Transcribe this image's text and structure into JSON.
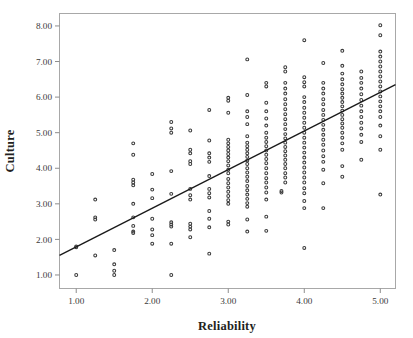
{
  "chart_data": {
    "type": "scatter",
    "title": "",
    "xlabel": "Reliability",
    "ylabel": "Culture",
    "xlim": [
      0.78,
      5.2
    ],
    "ylim": [
      0.62,
      8.35
    ],
    "grid": false,
    "legend": null,
    "xticks": [
      1.0,
      2.0,
      3.0,
      4.0,
      5.0
    ],
    "xtick_labels": [
      "1.00",
      "2.00",
      "3.00",
      "4.00",
      "5.00"
    ],
    "yticks": [
      1.0,
      2.0,
      3.0,
      4.0,
      5.0,
      6.0,
      7.0,
      8.0
    ],
    "ytick_labels": [
      "1.00",
      "2.00",
      "3.00",
      "4.00",
      "5.00",
      "6.00",
      "7.00",
      "8.00"
    ],
    "marker": "open-circle",
    "marker_color": "#3b3b3b",
    "fit_line": {
      "type": "linear",
      "x": [
        0.78,
        5.2
      ],
      "y": [
        1.55,
        6.35
      ],
      "slope": 1.086,
      "intercept": 0.703,
      "color": "#1a1a1a"
    },
    "series": [
      {
        "name": "Culture vs Reliability",
        "points": [
          [
            1.0,
            1.0
          ],
          [
            1.0,
            1.78
          ],
          [
            1.0,
            1.8
          ],
          [
            1.25,
            3.12
          ],
          [
            1.25,
            2.62
          ],
          [
            1.25,
            2.56
          ],
          [
            1.25,
            1.55
          ],
          [
            1.5,
            1.7
          ],
          [
            1.5,
            1.3
          ],
          [
            1.5,
            1.12
          ],
          [
            1.5,
            1.0
          ],
          [
            1.75,
            4.7
          ],
          [
            1.75,
            4.38
          ],
          [
            1.75,
            3.68
          ],
          [
            1.75,
            3.6
          ],
          [
            1.75,
            3.52
          ],
          [
            1.75,
            3.0
          ],
          [
            1.75,
            2.62
          ],
          [
            1.75,
            2.38
          ],
          [
            1.75,
            2.22
          ],
          [
            1.75,
            2.18
          ],
          [
            2.0,
            3.84
          ],
          [
            2.0,
            3.4
          ],
          [
            2.0,
            3.16
          ],
          [
            2.0,
            2.58
          ],
          [
            2.0,
            2.28
          ],
          [
            2.0,
            2.12
          ],
          [
            2.0,
            1.88
          ],
          [
            2.25,
            5.3
          ],
          [
            2.25,
            5.12
          ],
          [
            2.25,
            5.0
          ],
          [
            2.25,
            3.92
          ],
          [
            2.25,
            3.28
          ],
          [
            2.25,
            2.48
          ],
          [
            2.25,
            2.42
          ],
          [
            2.25,
            2.36
          ],
          [
            2.25,
            1.88
          ],
          [
            2.25,
            1.0
          ],
          [
            2.5,
            5.06
          ],
          [
            2.5,
            4.52
          ],
          [
            2.5,
            4.42
          ],
          [
            2.5,
            4.2
          ],
          [
            2.5,
            4.12
          ],
          [
            2.5,
            3.42
          ],
          [
            2.5,
            3.24
          ],
          [
            2.5,
            3.12
          ],
          [
            2.5,
            2.44
          ],
          [
            2.5,
            2.36
          ],
          [
            2.5,
            2.28
          ],
          [
            2.5,
            2.06
          ],
          [
            2.75,
            5.64
          ],
          [
            2.75,
            4.78
          ],
          [
            2.75,
            4.42
          ],
          [
            2.75,
            4.3
          ],
          [
            2.75,
            4.18
          ],
          [
            2.75,
            3.78
          ],
          [
            2.75,
            3.42
          ],
          [
            2.75,
            3.3
          ],
          [
            2.75,
            3.18
          ],
          [
            2.75,
            2.8
          ],
          [
            2.75,
            2.58
          ],
          [
            2.75,
            2.34
          ],
          [
            2.75,
            1.6
          ],
          [
            3.0,
            5.98
          ],
          [
            3.0,
            5.9
          ],
          [
            3.0,
            5.56
          ],
          [
            3.0,
            4.8
          ],
          [
            3.0,
            4.7
          ],
          [
            3.0,
            4.6
          ],
          [
            3.0,
            4.5
          ],
          [
            3.0,
            4.4
          ],
          [
            3.0,
            4.3
          ],
          [
            3.0,
            4.2
          ],
          [
            3.0,
            4.08
          ],
          [
            3.0,
            3.96
          ],
          [
            3.0,
            3.86
          ],
          [
            3.0,
            3.7
          ],
          [
            3.0,
            3.58
          ],
          [
            3.0,
            3.46
          ],
          [
            3.0,
            3.34
          ],
          [
            3.0,
            3.22
          ],
          [
            3.0,
            3.1
          ],
          [
            3.0,
            3.0
          ],
          [
            3.0,
            2.5
          ],
          [
            3.0,
            2.42
          ],
          [
            3.25,
            7.06
          ],
          [
            3.25,
            6.06
          ],
          [
            3.25,
            5.6
          ],
          [
            3.25,
            5.44
          ],
          [
            3.25,
            5.24
          ],
          [
            3.25,
            4.9
          ],
          [
            3.25,
            4.72
          ],
          [
            3.25,
            4.62
          ],
          [
            3.25,
            4.52
          ],
          [
            3.25,
            4.42
          ],
          [
            3.25,
            4.32
          ],
          [
            3.25,
            4.22
          ],
          [
            3.25,
            4.12
          ],
          [
            3.25,
            4.0
          ],
          [
            3.25,
            3.88
          ],
          [
            3.25,
            3.76
          ],
          [
            3.25,
            3.64
          ],
          [
            3.25,
            3.5
          ],
          [
            3.25,
            3.38
          ],
          [
            3.25,
            3.26
          ],
          [
            3.25,
            3.14
          ],
          [
            3.25,
            3.02
          ],
          [
            3.25,
            2.92
          ],
          [
            3.25,
            2.56
          ],
          [
            3.25,
            2.22
          ],
          [
            3.5,
            6.4
          ],
          [
            3.5,
            6.3
          ],
          [
            3.5,
            5.84
          ],
          [
            3.5,
            5.6
          ],
          [
            3.5,
            5.4
          ],
          [
            3.5,
            5.2
          ],
          [
            3.5,
            5.0
          ],
          [
            3.5,
            4.86
          ],
          [
            3.5,
            4.74
          ],
          [
            3.5,
            4.62
          ],
          [
            3.5,
            4.5
          ],
          [
            3.5,
            4.38
          ],
          [
            3.5,
            4.26
          ],
          [
            3.5,
            4.14
          ],
          [
            3.5,
            4.0
          ],
          [
            3.5,
            3.86
          ],
          [
            3.5,
            3.72
          ],
          [
            3.5,
            3.6
          ],
          [
            3.5,
            3.46
          ],
          [
            3.5,
            3.32
          ],
          [
            3.5,
            3.12
          ],
          [
            3.5,
            2.64
          ],
          [
            3.5,
            2.24
          ],
          [
            3.7,
            3.36
          ],
          [
            3.7,
            3.32
          ],
          [
            3.75,
            6.84
          ],
          [
            3.75,
            6.72
          ],
          [
            3.75,
            6.4
          ],
          [
            3.75,
            6.24
          ],
          [
            3.75,
            6.1
          ],
          [
            3.75,
            5.94
          ],
          [
            3.75,
            5.8
          ],
          [
            3.75,
            5.66
          ],
          [
            3.75,
            5.52
          ],
          [
            3.75,
            5.38
          ],
          [
            3.75,
            5.24
          ],
          [
            3.75,
            5.1
          ],
          [
            3.75,
            4.96
          ],
          [
            3.75,
            4.84
          ],
          [
            3.75,
            4.72
          ],
          [
            3.75,
            4.6
          ],
          [
            3.75,
            4.48
          ],
          [
            3.75,
            4.36
          ],
          [
            3.75,
            4.24
          ],
          [
            3.75,
            4.12
          ],
          [
            3.75,
            4.0
          ],
          [
            3.75,
            3.86
          ],
          [
            3.75,
            3.74
          ],
          [
            3.75,
            3.6
          ],
          [
            4.0,
            7.6
          ],
          [
            4.0,
            6.56
          ],
          [
            4.0,
            6.42
          ],
          [
            4.0,
            6.3
          ],
          [
            4.0,
            6.0
          ],
          [
            4.0,
            5.86
          ],
          [
            4.0,
            5.7
          ],
          [
            4.0,
            5.56
          ],
          [
            4.0,
            5.42
          ],
          [
            4.0,
            5.28
          ],
          [
            4.0,
            5.14
          ],
          [
            4.0,
            5.0
          ],
          [
            4.0,
            4.86
          ],
          [
            4.0,
            4.72
          ],
          [
            4.0,
            4.58
          ],
          [
            4.0,
            4.44
          ],
          [
            4.0,
            4.3
          ],
          [
            4.0,
            4.16
          ],
          [
            4.0,
            4.02
          ],
          [
            4.0,
            3.88
          ],
          [
            4.0,
            3.74
          ],
          [
            4.0,
            3.6
          ],
          [
            4.0,
            3.44
          ],
          [
            4.0,
            3.3
          ],
          [
            4.0,
            3.08
          ],
          [
            4.0,
            2.88
          ],
          [
            4.0,
            1.76
          ],
          [
            4.25,
            6.96
          ],
          [
            4.25,
            6.4
          ],
          [
            4.25,
            6.24
          ],
          [
            4.25,
            6.1
          ],
          [
            4.25,
            5.94
          ],
          [
            4.25,
            5.8
          ],
          [
            4.25,
            5.64
          ],
          [
            4.25,
            5.5
          ],
          [
            4.25,
            5.36
          ],
          [
            4.25,
            5.22
          ],
          [
            4.25,
            5.08
          ],
          [
            4.25,
            4.94
          ],
          [
            4.25,
            4.8
          ],
          [
            4.25,
            4.66
          ],
          [
            4.25,
            4.5
          ],
          [
            4.25,
            4.34
          ],
          [
            4.25,
            4.18
          ],
          [
            4.25,
            3.96
          ],
          [
            4.25,
            3.58
          ],
          [
            4.25,
            2.88
          ],
          [
            4.5,
            7.3
          ],
          [
            4.5,
            6.88
          ],
          [
            4.5,
            6.66
          ],
          [
            4.5,
            6.5
          ],
          [
            4.5,
            6.36
          ],
          [
            4.5,
            6.22
          ],
          [
            4.5,
            6.1
          ],
          [
            4.5,
            5.98
          ],
          [
            4.5,
            5.86
          ],
          [
            4.5,
            5.74
          ],
          [
            4.5,
            5.62
          ],
          [
            4.5,
            5.5
          ],
          [
            4.5,
            5.38
          ],
          [
            4.5,
            5.26
          ],
          [
            4.5,
            5.14
          ],
          [
            4.5,
            5.0
          ],
          [
            4.5,
            4.86
          ],
          [
            4.5,
            4.7
          ],
          [
            4.5,
            4.52
          ],
          [
            4.5,
            4.06
          ],
          [
            4.5,
            3.76
          ],
          [
            4.75,
            6.72
          ],
          [
            4.75,
            6.54
          ],
          [
            4.75,
            6.4
          ],
          [
            4.75,
            6.24
          ],
          [
            4.75,
            6.08
          ],
          [
            4.75,
            5.92
          ],
          [
            4.75,
            5.76
          ],
          [
            4.75,
            5.6
          ],
          [
            4.75,
            5.44
          ],
          [
            4.75,
            5.28
          ],
          [
            4.75,
            5.12
          ],
          [
            4.75,
            4.94
          ],
          [
            4.75,
            4.74
          ],
          [
            4.75,
            4.24
          ],
          [
            5.0,
            8.02
          ],
          [
            5.0,
            7.74
          ],
          [
            5.0,
            7.28
          ],
          [
            5.0,
            7.14
          ],
          [
            5.0,
            7.0
          ],
          [
            5.0,
            6.86
          ],
          [
            5.0,
            6.72
          ],
          [
            5.0,
            6.58
          ],
          [
            5.0,
            6.44
          ],
          [
            5.0,
            6.3
          ],
          [
            5.0,
            6.16
          ],
          [
            5.0,
            6.02
          ],
          [
            5.0,
            5.88
          ],
          [
            5.0,
            5.74
          ],
          [
            5.0,
            5.6
          ],
          [
            5.0,
            5.44
          ],
          [
            5.0,
            5.2
          ],
          [
            5.0,
            4.9
          ],
          [
            5.0,
            4.52
          ],
          [
            5.0,
            3.26
          ]
        ]
      }
    ]
  }
}
